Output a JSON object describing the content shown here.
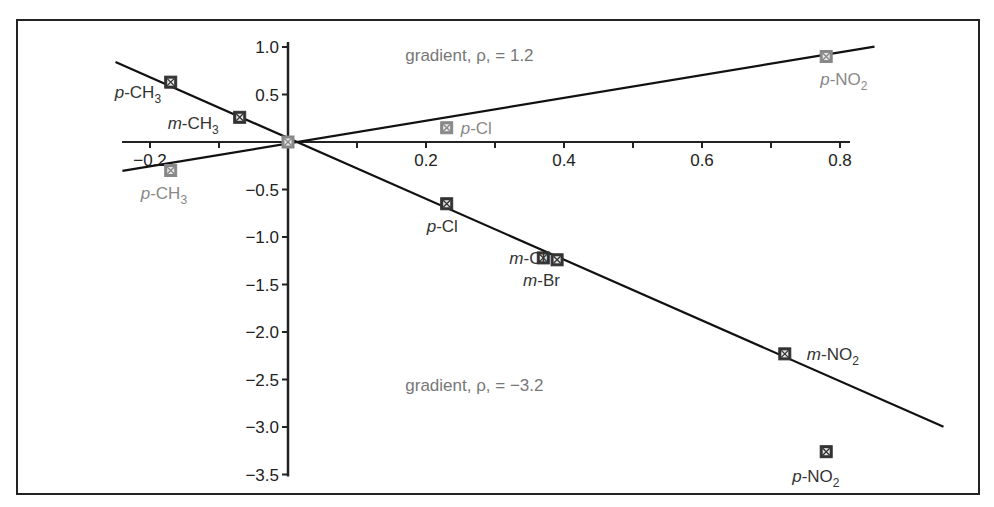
{
  "chart_data": {
    "type": "scatter",
    "title": "",
    "xlabel": "",
    "ylabel": "",
    "xlim": [
      -0.2,
      0.8
    ],
    "ylim": [
      -3.5,
      1.0
    ],
    "x_ticks": [
      -0.2,
      -0.1,
      0,
      0.1,
      0.2,
      0.3,
      0.4,
      0.5,
      0.6,
      0.7,
      0.8
    ],
    "x_tick_labels": [
      "-0.2",
      "",
      "",
      "",
      "0.2",
      "",
      "0.4",
      "",
      "0.6",
      "",
      "0.8"
    ],
    "y_ticks": [
      1.0,
      0.5,
      0,
      -0.5,
      -1.0,
      -1.5,
      -2.0,
      -2.5,
      -3.0,
      -3.5
    ],
    "y_tick_labels": [
      "1.0",
      "0.5",
      "",
      "-0.5",
      "-1.0",
      "-1.5",
      "-2.0",
      "-2.5",
      "-3.0",
      "-3.5"
    ],
    "grid": false,
    "legend": null,
    "series": [
      {
        "name": "gradient, ρ, = 1.2",
        "color": "#888888",
        "fit_line": {
          "slope": 1.2,
          "x_range": [
            -0.24,
            0.85
          ]
        },
        "points": [
          {
            "label_prefix": "p",
            "label_group": "-CH",
            "label_sub": "3",
            "x": -0.17,
            "y": -0.3,
            "label_dx": -30,
            "label_dy": 28
          },
          {
            "label_prefix": "",
            "label_group": "",
            "label_sub": "",
            "x": 0.0,
            "y": 0.0,
            "label_dx": 0,
            "label_dy": 0
          },
          {
            "label_prefix": "p",
            "label_group": "-Cl",
            "label_sub": "",
            "x": 0.23,
            "y": 0.15,
            "label_dx": 14,
            "label_dy": 6
          },
          {
            "label_prefix": "p",
            "label_group": "-NO",
            "label_sub": "2",
            "x": 0.78,
            "y": 0.9,
            "label_dx": -6,
            "label_dy": 28
          }
        ]
      },
      {
        "name": "gradient, ρ, = -3.2",
        "color": "#333333",
        "fit_line": {
          "slope": -3.2,
          "x_range": [
            -0.25,
            0.95
          ]
        },
        "points": [
          {
            "label_prefix": "p",
            "label_group": "-CH",
            "label_sub": "3",
            "x": -0.17,
            "y": 0.63,
            "label_dx": -56,
            "label_dy": 16
          },
          {
            "label_prefix": "m",
            "label_group": "-CH",
            "label_sub": "3",
            "x": -0.07,
            "y": 0.26,
            "label_dx": -72,
            "label_dy": 12
          },
          {
            "label_prefix": "p",
            "label_group": "-Cl",
            "label_sub": "",
            "x": 0.23,
            "y": -0.65,
            "label_dx": -20,
            "label_dy": 28
          },
          {
            "label_prefix": "m",
            "label_group": "-Cl",
            "label_sub": "",
            "x": 0.37,
            "y": -1.22,
            "label_dx": -34,
            "label_dy": 6
          },
          {
            "label_prefix": "m",
            "label_group": "-Br",
            "label_sub": "",
            "x": 0.39,
            "y": -1.24,
            "label_dx": -34,
            "label_dy": 26
          },
          {
            "label_prefix": "m",
            "label_group": "-NO",
            "label_sub": "2",
            "x": 0.72,
            "y": -2.23,
            "label_dx": 22,
            "label_dy": 6
          },
          {
            "label_prefix": "p",
            "label_group": "-NO",
            "label_sub": "2",
            "x": 0.78,
            "y": -3.26,
            "label_dx": -34,
            "label_dy": 30
          }
        ]
      }
    ],
    "annotations": [
      {
        "text": "gradient, ρ, = 1.2",
        "x": 0.17,
        "y": 0.85,
        "color": "#777777"
      },
      {
        "text": "gradient, ρ, = −3.2",
        "x": 0.17,
        "y": -2.62,
        "color": "#666666"
      }
    ]
  }
}
